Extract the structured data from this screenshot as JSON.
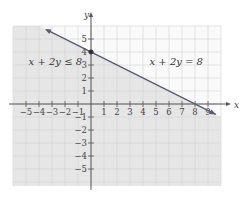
{
  "chart_data": {
    "type": "line",
    "title": "",
    "xlabel": "x",
    "ylabel": "y",
    "xlim": [
      -6,
      10
    ],
    "ylim": [
      -6.3,
      6
    ],
    "grid": true,
    "x_ticks": [
      -5,
      -4,
      -3,
      -2,
      -1,
      1,
      2,
      3,
      4,
      5,
      6,
      7,
      8,
      9
    ],
    "y_ticks": [
      -5,
      -4,
      -3,
      -2,
      -1,
      1,
      2,
      3,
      4,
      5
    ],
    "series": [
      {
        "name": "x + 2y = 8",
        "kind": "boundary-line",
        "style": "solid",
        "points": [
          [
            -3.4,
            5.7
          ],
          [
            10,
            -1
          ]
        ]
      }
    ],
    "shaded_region": {
      "inequality": "x + 2y ≤ 8",
      "side": "below-left of line",
      "color": "#e8e8e8"
    },
    "highlighted_points": [
      {
        "x": 0,
        "y": 4
      }
    ],
    "annotations": [
      {
        "text": "x + 2y ≤ 8",
        "x": -4.8,
        "y": 3
      },
      {
        "text": "x + 2y = 8",
        "x": 4.5,
        "y": 3
      }
    ],
    "colors": {
      "line": "#555f6b",
      "shade": "#e6e6e6",
      "grid": "#d4d4d4",
      "axis": "#555"
    }
  }
}
